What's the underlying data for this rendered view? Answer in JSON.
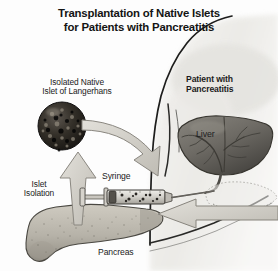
{
  "figure": {
    "title_line1": "Transplantation of Native Islets",
    "title_line2": "for Patients with Pancreatitis",
    "background_color": "#fdfdfd",
    "text_color": "#1b1b1b"
  },
  "labels": {
    "islet_source": "Isolated Native\nIslet of Langerhans",
    "patient": "Patient with\nPancreatitis",
    "liver": "Liver",
    "islet_isolation": "Islet\nIsolation",
    "syringe": "Syringe",
    "pancreas": "Pancreas"
  },
  "colors": {
    "islet_sphere": "#2a2724",
    "liver": "#6f6d68",
    "liver_dark": "#4a4845",
    "pancreas": "#b5b1a7",
    "arrow_fill": "#cfcdc7",
    "arrow_stroke": "#8e8b84",
    "body_shade": "#e3e2de",
    "outline": "#1d1d1c",
    "syringe_body": "#d9d7d1",
    "needle": "#55524d"
  },
  "elements": {
    "islet_sphere_name": "isolated-islet-sphere",
    "liver_organ_name": "liver-organ",
    "pancreas_organ_name": "pancreas-organ",
    "syringe_name": "syringe-with-islets",
    "torso_name": "patient-torso",
    "isolation_arrow_name": "islet-isolation-arrow",
    "transfer_arrow_name": "islet-to-syringe-arrow",
    "pancreas_pointer_name": "pancreas-pointer-arrow"
  }
}
